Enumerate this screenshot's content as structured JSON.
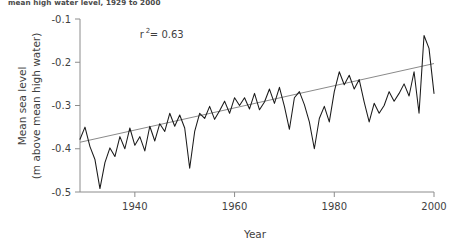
{
  "caption": "mean high water level, 1929 to 2000",
  "chart_data": {
    "type": "line",
    "title": "",
    "xlabel": "Year",
    "ylabel": "Mean sea level\n(m above mean high water)",
    "ylabel_line1": "Mean sea level",
    "ylabel_line2": "(m above mean high water)",
    "xlim": [
      1929,
      2000
    ],
    "ylim": [
      -0.5,
      -0.1
    ],
    "xticks": [
      1940,
      1960,
      1980,
      2000
    ],
    "xticklabels": [
      "1940",
      "1960",
      "1980",
      "2000"
    ],
    "yticks": [
      -0.1,
      -0.2,
      -0.3,
      -0.4,
      -0.5
    ],
    "yticklabels": [
      "-0.1",
      "-0.2",
      "-0.3",
      "-0.4",
      "-0.5"
    ],
    "grid": false,
    "legend": null,
    "annotations": [
      {
        "name": "r-squared",
        "text": "r",
        "sup": "2",
        "rest": " = 0.63",
        "full": "r² = 0.63",
        "x": 1941,
        "y": -0.145
      }
    ],
    "series": [
      {
        "name": "Mean sea level",
        "color": "#1a1a1a",
        "x": [
          1929,
          1930,
          1931,
          1932,
          1933,
          1934,
          1935,
          1936,
          1937,
          1938,
          1939,
          1940,
          1941,
          1942,
          1943,
          1944,
          1945,
          1946,
          1947,
          1948,
          1949,
          1950,
          1951,
          1952,
          1953,
          1954,
          1955,
          1956,
          1957,
          1958,
          1959,
          1960,
          1961,
          1962,
          1963,
          1964,
          1965,
          1966,
          1967,
          1968,
          1969,
          1970,
          1971,
          1972,
          1973,
          1974,
          1975,
          1976,
          1977,
          1978,
          1979,
          1980,
          1981,
          1982,
          1983,
          1984,
          1985,
          1986,
          1987,
          1988,
          1989,
          1990,
          1991,
          1992,
          1993,
          1994,
          1995,
          1996,
          1997,
          1998,
          1999,
          2000
        ],
        "y": [
          -0.378,
          -0.35,
          -0.395,
          -0.425,
          -0.492,
          -0.432,
          -0.398,
          -0.418,
          -0.372,
          -0.4,
          -0.352,
          -0.392,
          -0.372,
          -0.405,
          -0.348,
          -0.382,
          -0.342,
          -0.36,
          -0.318,
          -0.348,
          -0.322,
          -0.352,
          -0.445,
          -0.36,
          -0.318,
          -0.33,
          -0.302,
          -0.332,
          -0.312,
          -0.29,
          -0.318,
          -0.282,
          -0.3,
          -0.282,
          -0.308,
          -0.272,
          -0.31,
          -0.292,
          -0.262,
          -0.295,
          -0.258,
          -0.302,
          -0.355,
          -0.282,
          -0.268,
          -0.298,
          -0.338,
          -0.4,
          -0.33,
          -0.302,
          -0.338,
          -0.268,
          -0.222,
          -0.252,
          -0.23,
          -0.262,
          -0.24,
          -0.292,
          -0.338,
          -0.295,
          -0.318,
          -0.3,
          -0.268,
          -0.29,
          -0.272,
          -0.25,
          -0.278,
          -0.222,
          -0.318,
          -0.138,
          -0.168,
          -0.272
        ]
      }
    ],
    "trendline": {
      "name": "Linear fit",
      "color": "#8a8a8a",
      "x": [
        1929,
        2000
      ],
      "y": [
        -0.385,
        -0.203
      ],
      "r_squared": 0.63
    }
  }
}
